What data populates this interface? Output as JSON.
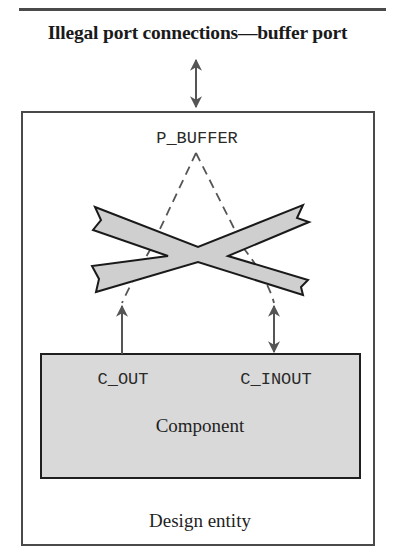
{
  "title": "Illegal port connections—buffer port",
  "outer_box": {
    "label": "Design entity"
  },
  "port": {
    "name": "P_BUFFER"
  },
  "component": {
    "label": "Component",
    "ports": [
      {
        "name": "C_OUT",
        "direction": "out"
      },
      {
        "name": "C_INOUT",
        "direction": "inout"
      }
    ]
  },
  "illegal_marker": {
    "type": "cross",
    "meaning": "illegal connection"
  },
  "colors": {
    "line": "#4a4a4a",
    "component_fill": "#d9d9d9",
    "cross_fill": "#cfcfcf",
    "arrow": "#555555"
  }
}
